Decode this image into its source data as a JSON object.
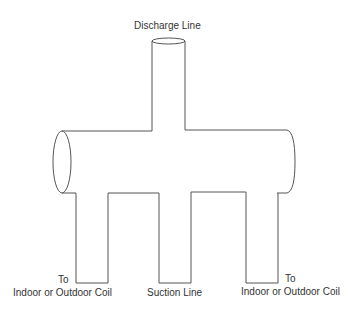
{
  "diagram": {
    "labels": {
      "discharge": "Discharge Line",
      "left_to": "To",
      "left_coil": "Indoor or Outdoor Coil",
      "suction": "Suction Line",
      "right_to": "To",
      "right_coil": "Indoor or Outdoor Coil"
    },
    "colors": {
      "stroke": "#555555",
      "text": "#333333",
      "background": "#ffffff"
    }
  }
}
